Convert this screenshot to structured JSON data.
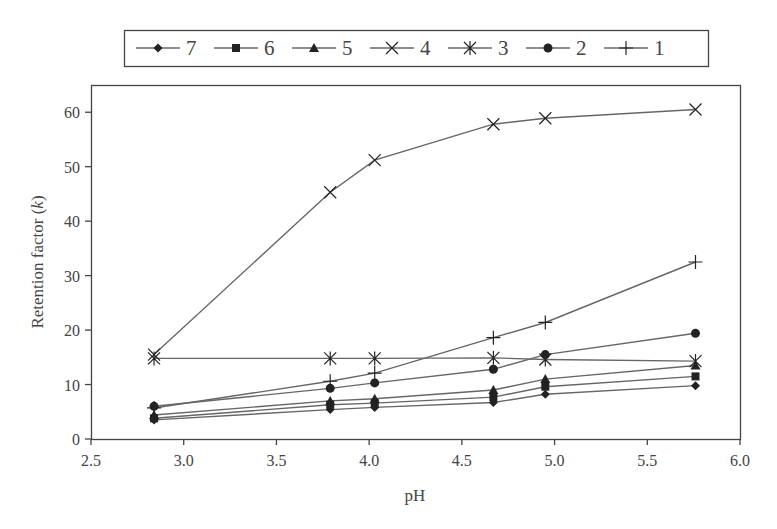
{
  "chart_data": {
    "type": "line",
    "title": "",
    "xlabel": "pH",
    "ylabel": "Retention factor (k)",
    "ylabel_parts": {
      "main": "Retention factor (",
      "italic": "k",
      "end": ")"
    },
    "xlim": [
      2.5,
      6.0
    ],
    "ylim": [
      0,
      65
    ],
    "xticks": [
      2.5,
      3.0,
      3.5,
      4.0,
      4.5,
      5.0,
      5.5,
      6.0
    ],
    "xtick_labels": [
      "2.5",
      "3.0",
      "3.5",
      "4.0",
      "4.5",
      "5.0",
      "5.5",
      "6.0"
    ],
    "yticks": [
      0,
      10,
      20,
      30,
      40,
      50,
      60
    ],
    "ytick_labels": [
      "0",
      "10",
      "20",
      "30",
      "40",
      "50",
      "60"
    ],
    "grid": false,
    "legend_position": "top-outside",
    "x": [
      2.84,
      3.79,
      4.03,
      4.67,
      4.95,
      5.76
    ],
    "series": [
      {
        "name": "7",
        "marker": "diamond",
        "values": [
          3.5,
          5.4,
          5.8,
          6.7,
          8.2,
          9.8
        ]
      },
      {
        "name": "6",
        "marker": "square",
        "values": [
          3.8,
          6.3,
          6.6,
          7.7,
          9.6,
          11.5
        ]
      },
      {
        "name": "5",
        "marker": "triangle",
        "values": [
          4.4,
          7.0,
          7.4,
          9.0,
          11.0,
          13.5
        ]
      },
      {
        "name": "4",
        "marker": "x",
        "values": [
          15.5,
          45.3,
          51.2,
          57.8,
          58.9,
          60.5
        ]
      },
      {
        "name": "3",
        "marker": "asterisk",
        "values": [
          14.8,
          14.8,
          14.8,
          14.9,
          14.6,
          14.3
        ]
      },
      {
        "name": "2",
        "marker": "circle",
        "values": [
          6.0,
          9.3,
          10.3,
          12.8,
          15.5,
          19.4
        ]
      },
      {
        "name": "1",
        "marker": "plus",
        "values": [
          5.7,
          10.6,
          12.1,
          18.6,
          21.4,
          32.5
        ]
      }
    ]
  },
  "colors": {
    "line": "#666666",
    "marker": "#222222",
    "axis": "#444444",
    "text": "#444444"
  }
}
